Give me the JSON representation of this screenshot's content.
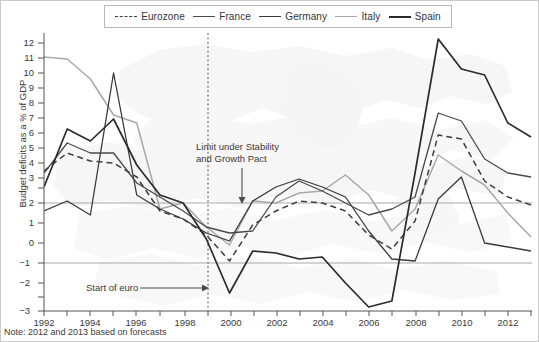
{
  "chart_data": {
    "type": "line",
    "title": "",
    "xlabel": "",
    "ylabel": "Budget deficits as a % of GDP",
    "xlim": [
      1992,
      2013
    ],
    "ylim": [
      -3,
      12
    ],
    "grid": "horizontal gridlines at 0 and 3",
    "legend_position": "top-center",
    "x": [
      1992,
      1993,
      1994,
      1995,
      1996,
      1997,
      1998,
      1999,
      2000,
      2001,
      2002,
      2003,
      2004,
      2005,
      2006,
      2007,
      2008,
      2009,
      2010,
      2011,
      2012,
      2013
    ],
    "series": [
      {
        "name": "Eurozone",
        "style": "dashed",
        "color": "#3f3f3f",
        "values": [
          4.6,
          5.5,
          5.1,
          5.0,
          4.3,
          2.6,
          2.2,
          1.4,
          0.1,
          1.9,
          2.6,
          3.1,
          3.0,
          2.6,
          1.4,
          0.7,
          2.1,
          6.4,
          6.2,
          4.1,
          3.3,
          2.9
        ]
      },
      {
        "name": "France",
        "style": "solid",
        "color": "#4a4a4a",
        "values": [
          4.5,
          6.0,
          5.5,
          5.5,
          4.0,
          3.3,
          2.6,
          1.8,
          1.5,
          1.6,
          3.3,
          4.1,
          3.6,
          3.0,
          2.4,
          2.7,
          3.3,
          7.5,
          7.1,
          5.2,
          4.5,
          4.3
        ]
      },
      {
        "name": "Germany",
        "style": "solid",
        "color": "#3a3a3a",
        "values": [
          2.6,
          3.1,
          2.4,
          9.5,
          3.4,
          2.7,
          2.2,
          1.5,
          1.1,
          3.1,
          3.8,
          4.2,
          3.8,
          3.3,
          1.6,
          0.2,
          0.1,
          3.2,
          4.3,
          1.0,
          0.8,
          0.6
        ]
      },
      {
        "name": "Italy",
        "style": "solid",
        "color": "#a8a8a8",
        "values": [
          10.3,
          10.2,
          9.2,
          7.4,
          7.0,
          2.7,
          3.0,
          1.8,
          0.9,
          3.1,
          3.0,
          3.5,
          3.6,
          4.4,
          3.4,
          1.6,
          2.7,
          5.4,
          4.6,
          3.9,
          2.5,
          1.3
        ]
      },
      {
        "name": "Spain",
        "style": "solid",
        "color": "#2b2b2b",
        "values": [
          3.8,
          6.7,
          6.1,
          7.2,
          4.9,
          3.4,
          3.0,
          1.2,
          -1.5,
          0.6,
          0.5,
          0.2,
          0.3,
          -1.0,
          -2.2,
          -1.9,
          4.5,
          11.2,
          9.7,
          9.4,
          7.0,
          6.3
        ]
      }
    ],
    "y_ticks": [
      -3,
      -2,
      -1,
      0,
      1,
      2,
      3,
      4,
      5,
      6,
      7,
      8,
      9,
      10,
      11,
      12
    ],
    "x_ticks": [
      1992,
      1994,
      1996,
      1998,
      2000,
      2002,
      2004,
      2006,
      2008,
      2010,
      2012
    ],
    "x_minor_ticks": [
      1993,
      1995,
      1997,
      1999,
      2001,
      2003,
      2005,
      2007,
      2009,
      2011,
      2013
    ],
    "gridlines": [
      0,
      3
    ],
    "annotations": [
      {
        "name": "limit-under-stability-and-growth-pact",
        "line1": "Limit under Stability",
        "line2": "and Growth Pact",
        "points_to_value": 3
      },
      {
        "name": "start-of-euro",
        "text": "Start of euro",
        "points_to_year": 1999
      }
    ],
    "vertical_marker": {
      "year": 1999,
      "style": "dotted"
    },
    "note": "Note: 2012 and 2013 based on forecasts"
  },
  "legend": {
    "items": [
      {
        "label": "Eurozone",
        "color": "#3f3f3f",
        "dashed": true
      },
      {
        "label": "France",
        "color": "#4a4a4a",
        "dashed": false
      },
      {
        "label": "Germany",
        "color": "#3a3a3a",
        "dashed": false
      },
      {
        "label": "Italy",
        "color": "#a8a8a8",
        "dashed": false
      },
      {
        "label": "Spain",
        "color": "#2b2b2b",
        "dashed": false
      }
    ]
  },
  "axes": {
    "y_title": "Budget deficits as a % of GDP",
    "y_labels": [
      "12",
      "11",
      "10",
      "9",
      "8",
      "7",
      "6",
      "5",
      "4",
      "3",
      "2",
      "1",
      "0",
      "−1",
      "−2",
      "−3"
    ],
    "x_labels": [
      "1992",
      "1994",
      "1996",
      "1998",
      "2000",
      "2002",
      "2004",
      "2006",
      "2008",
      "2010",
      "2012"
    ]
  },
  "footer": {
    "note": "Note: 2012 and 2013 based on forecasts"
  },
  "annotations": {
    "limit_line1": "Limit under Stability",
    "limit_line2": "and Growth Pact",
    "start_of_euro": "Start of euro"
  }
}
